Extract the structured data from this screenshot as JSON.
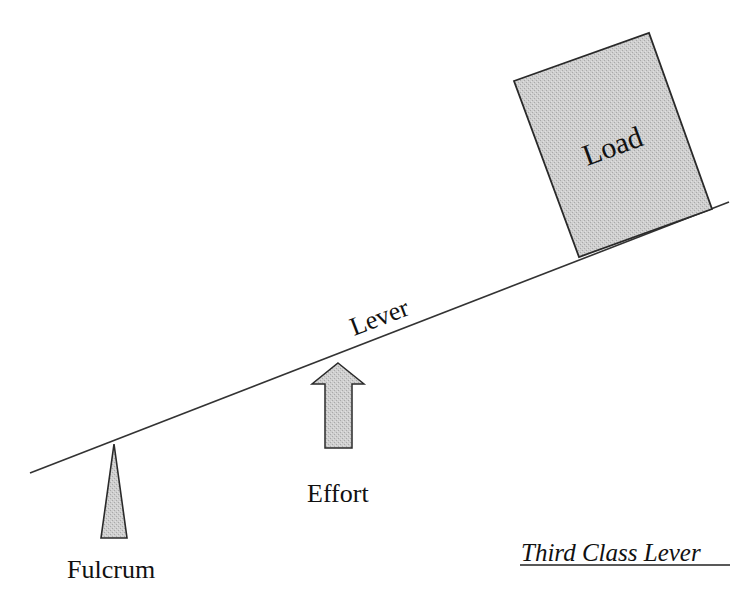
{
  "title": "Third Class Lever",
  "labels": {
    "load": "Load",
    "lever": "Lever",
    "effort": "Effort",
    "fulcrum": "Fulcrum",
    "caption": "Third Class Lever"
  },
  "colors": {
    "background": "#ffffff",
    "line": "#333333",
    "fill": "#c8c8c8",
    "text": "#111111"
  },
  "elements": {
    "lever": {
      "x1": 30,
      "y1": 473,
      "x2": 729,
      "y2": 202
    },
    "load_box": {
      "corners": [
        [
          514,
          81
        ],
        [
          649,
          33
        ],
        [
          712,
          209
        ],
        [
          579,
          257
        ]
      ]
    },
    "fulcrum": {
      "apex": [
        114,
        444
      ],
      "base_left": [
        101,
        538
      ],
      "base_right": [
        127,
        538
      ]
    },
    "effort_arrow": {
      "tip": [
        338,
        363
      ],
      "head_left": 312,
      "head_right": 364,
      "head_base_y": 384,
      "shaft_left": 325,
      "shaft_right": 352,
      "bottom": 448
    }
  }
}
